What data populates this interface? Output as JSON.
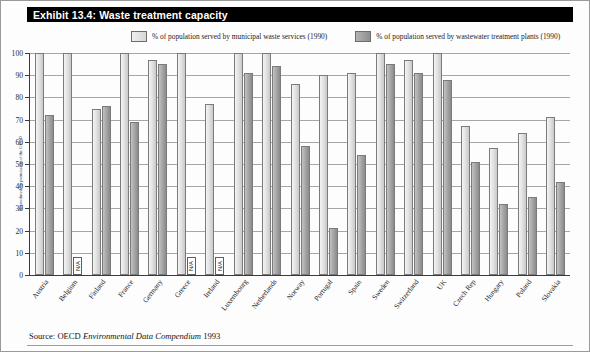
{
  "exhibit": {
    "title": "Exhibit 13.4: Waste treatment capacity",
    "source": "Source: OECD ",
    "source_italic": "Environmental Data Compendium",
    "source_year": " 1993",
    "side_credit": "Reproduced by permission of the OECD"
  },
  "legend": {
    "items": [
      {
        "label": "% of population served by municipal waste services (1990)",
        "swatch": "light-swatch-icon",
        "color": "#dcdcdc"
      },
      {
        "label": "% of population served by wastewater treatment plants (1990)",
        "swatch": "dark-swatch-icon",
        "color": "#9b9b9b"
      }
    ]
  },
  "chart_data": {
    "type": "bar",
    "title": "Exhibit 13.4: Waste treatment capacity",
    "xlabel": "",
    "ylabel": "",
    "ylim": [
      0,
      100
    ],
    "yticks": [
      0,
      10,
      20,
      30,
      40,
      50,
      60,
      70,
      80,
      90,
      100
    ],
    "grid": true,
    "legend_position": "top",
    "na_label": "N/A",
    "categories": [
      "Austria",
      "Belgium",
      "Finland",
      "France",
      "Germany",
      "Greece",
      "Ireland",
      "Luxembourg",
      "Netherlands",
      "Norway",
      "Portugal",
      "Spain",
      "Sweden",
      "Switzerland",
      "UK",
      "Czech Rep",
      "Hungary",
      "Poland",
      "Slovakia"
    ],
    "series": [
      {
        "name": "% of population served by municipal waste services (1990)",
        "values": [
          100,
          100,
          75,
          100,
          97,
          100,
          77,
          100,
          100,
          86,
          90,
          91,
          100,
          97,
          100,
          67,
          57,
          64,
          71
        ]
      },
      {
        "name": "% of population served by wastewater treatment plants (1990)",
        "values": [
          72,
          null,
          76,
          69,
          95,
          null,
          null,
          91,
          94,
          58,
          21,
          54,
          95,
          91,
          88,
          51,
          32,
          35,
          42
        ]
      }
    ]
  }
}
